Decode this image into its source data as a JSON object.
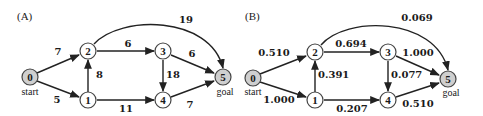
{
  "panels": [
    {
      "label": "(A)",
      "nodes": [
        {
          "id": "0",
          "sublabel": "start",
          "shaded": true
        },
        {
          "id": "1",
          "shaded": false
        },
        {
          "id": "2",
          "shaded": false
        },
        {
          "id": "3",
          "shaded": false
        },
        {
          "id": "4",
          "shaded": false
        },
        {
          "id": "5",
          "sublabel": "goal",
          "shaded": true
        }
      ],
      "edges": [
        {
          "from": "0",
          "to": "2",
          "weight": "7"
        },
        {
          "from": "0",
          "to": "1",
          "weight": "5"
        },
        {
          "from": "1",
          "to": "2",
          "weight": "8"
        },
        {
          "from": "2",
          "to": "3",
          "weight": "6"
        },
        {
          "from": "2",
          "to": "5",
          "weight": "19"
        },
        {
          "from": "1",
          "to": "4",
          "weight": "11"
        },
        {
          "from": "3",
          "to": "4",
          "weight": "18"
        },
        {
          "from": "3",
          "to": "5",
          "weight": "6"
        },
        {
          "from": "4",
          "to": "5",
          "weight": "7"
        }
      ]
    },
    {
      "label": "(B)",
      "nodes": [
        {
          "id": "0",
          "sublabel": "start",
          "shaded": true
        },
        {
          "id": "1",
          "shaded": false
        },
        {
          "id": "2",
          "shaded": false
        },
        {
          "id": "3",
          "shaded": false
        },
        {
          "id": "4",
          "shaded": false
        },
        {
          "id": "5",
          "sublabel": "goal",
          "shaded": true
        }
      ],
      "edges": [
        {
          "from": "0",
          "to": "2",
          "weight": "0.510"
        },
        {
          "from": "0",
          "to": "1",
          "weight": "1.000"
        },
        {
          "from": "1",
          "to": "2",
          "weight": "0.391"
        },
        {
          "from": "2",
          "to": "3",
          "weight": "0.694"
        },
        {
          "from": "2",
          "to": "5",
          "weight": "0.069"
        },
        {
          "from": "1",
          "to": "4",
          "weight": "0.207"
        },
        {
          "from": "3",
          "to": "4",
          "weight": "0.077"
        },
        {
          "from": "3",
          "to": "5",
          "weight": "1.000"
        },
        {
          "from": "4",
          "to": "5",
          "weight": "0.510"
        }
      ]
    }
  ]
}
